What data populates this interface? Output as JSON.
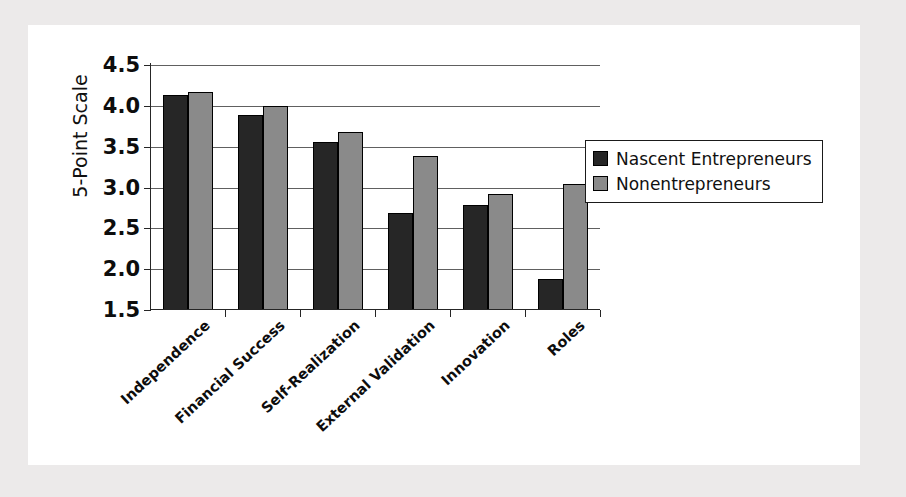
{
  "chart_data": {
    "type": "bar",
    "title": "",
    "xlabel": "",
    "ylabel": "5-Point Scale",
    "ylim": [
      1.5,
      4.5
    ],
    "yticks": [
      1.5,
      2.0,
      2.5,
      3.0,
      3.5,
      4.0,
      4.5
    ],
    "ytick_labels": [
      "1.5",
      "2.0",
      "2.5",
      "3.0",
      "3.5",
      "4.0",
      "4.5"
    ],
    "grid": "horizontal",
    "legend_position": "right",
    "categories": [
      "Independence",
      "Financial Success",
      "Self-Realization",
      "External Validation",
      "Innovation",
      "Roles"
    ],
    "series": [
      {
        "name": "Nascent Entrepreneurs",
        "color": "#262626",
        "values": [
          4.13,
          3.89,
          3.56,
          2.69,
          2.79,
          1.88
        ]
      },
      {
        "name": "Nonentrepreneurs",
        "color": "#8a8a8a",
        "values": [
          4.17,
          4.0,
          3.68,
          3.38,
          2.92,
          3.04
        ]
      }
    ]
  },
  "legend": {
    "items": [
      {
        "label": "Nascent Entrepreneurs",
        "swatch": "dark-swatch"
      },
      {
        "label": "Nonentrepreneurs",
        "swatch": "gray-swatch"
      }
    ]
  },
  "colors": {
    "page_background": "#eceaea",
    "card_background": "#ffffff",
    "axis": "#262626",
    "gridline": "#606060",
    "series_dark": "#262626",
    "series_gray": "#8a8a8a"
  }
}
